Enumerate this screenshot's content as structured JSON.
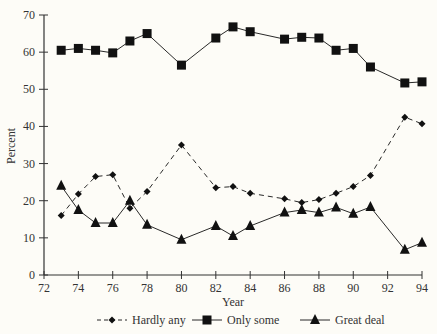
{
  "chart_data": {
    "type": "line",
    "title": "",
    "xlabel": "Year",
    "ylabel": "Percent",
    "xlim": [
      72,
      94
    ],
    "ylim": [
      0,
      70
    ],
    "x_ticks": [
      72,
      74,
      76,
      78,
      80,
      82,
      84,
      86,
      88,
      90,
      92,
      94
    ],
    "y_ticks": [
      0,
      10,
      20,
      30,
      40,
      50,
      60,
      70
    ],
    "grid": false,
    "legend_position": "bottom",
    "x": [
      73,
      74,
      75,
      76,
      77,
      78,
      80,
      82,
      83,
      84,
      86,
      87,
      88,
      89,
      90,
      91,
      93,
      94
    ],
    "series": [
      {
        "name": "Hardly any",
        "marker": "diamond",
        "line": "dashed",
        "values": [
          16,
          21.8,
          26.5,
          27,
          18,
          22.5,
          35,
          23.5,
          23.8,
          22,
          20.5,
          19.5,
          20.3,
          22,
          23.8,
          26.8,
          42.5,
          40.7
        ]
      },
      {
        "name": "Only some",
        "marker": "square",
        "line": "solid",
        "values": [
          60.5,
          61,
          60.5,
          59.8,
          63,
          65,
          56.5,
          63.8,
          66.8,
          65.5,
          63.5,
          64,
          63.8,
          60.5,
          61,
          56,
          51.7,
          52
        ]
      },
      {
        "name": "Great deal",
        "marker": "triangle",
        "line": "solid",
        "values": [
          24,
          17.5,
          14,
          14,
          20,
          13.5,
          9.5,
          13.2,
          10.5,
          13.2,
          16.8,
          17.5,
          16.8,
          18.2,
          16.5,
          18.3,
          6.8,
          8.7
        ]
      }
    ]
  },
  "colors": {
    "background": "#fdfcf7",
    "ink": "#111111",
    "axis": "#333333"
  }
}
